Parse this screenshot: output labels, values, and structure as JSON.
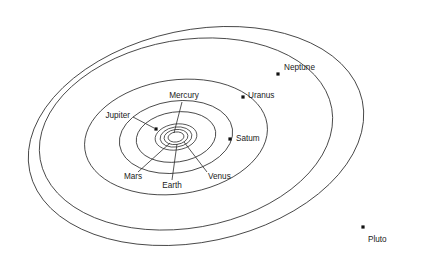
{
  "diagram": {
    "background_color": "#ffffff",
    "line_color": "#2b2b2b",
    "dot_color": "#111111",
    "text_color": "#1a1a1a",
    "center": {
      "x": 176,
      "y": 137
    }
  },
  "planets": [
    {
      "name": "Mercury",
      "label": "Mercury",
      "label_x": 184,
      "label_y": 96,
      "label_anchor": "middle",
      "orbit": {
        "cx": 176,
        "cy": 137,
        "rx": 8,
        "ry": 5,
        "rotation": -8
      },
      "leader": {
        "x1": 182,
        "y1": 102,
        "x2": 174,
        "y2": 133
      },
      "has_dot": false
    },
    {
      "name": "Venus",
      "label": "Venus",
      "label_x": 208,
      "label_y": 177,
      "label_anchor": "start",
      "orbit": {
        "cx": 176,
        "cy": 137,
        "rx": 12,
        "ry": 7.5,
        "rotation": -8
      },
      "leader": {
        "x1": 207,
        "y1": 172,
        "x2": 184,
        "y2": 142
      },
      "has_dot": false
    },
    {
      "name": "Earth",
      "label": "Earth",
      "label_x": 172,
      "label_y": 186,
      "label_anchor": "middle",
      "orbit": {
        "cx": 176,
        "cy": 137,
        "rx": 16,
        "ry": 10,
        "rotation": -8
      },
      "leader": {
        "x1": 172,
        "y1": 180,
        "x2": 177,
        "y2": 144
      },
      "has_dot": false
    },
    {
      "name": "Mars",
      "label": "Mars",
      "label_x": 133,
      "label_y": 177,
      "label_anchor": "middle",
      "orbit": {
        "cx": 176,
        "cy": 137,
        "rx": 21,
        "ry": 13,
        "rotation": -8
      },
      "leader": {
        "x1": 138,
        "y1": 172,
        "x2": 170,
        "y2": 143
      },
      "has_dot": false
    },
    {
      "name": "Jupiter",
      "label": "Jupiter",
      "label_x": 130,
      "label_y": 116,
      "label_anchor": "end",
      "orbit": {
        "cx": 176,
        "cy": 137,
        "rx": 40,
        "ry": 25,
        "rotation": -8
      },
      "leader": {
        "x1": 133,
        "y1": 117,
        "x2": 154,
        "y2": 128
      },
      "has_dot": true,
      "dot_x": 156,
      "dot_y": 129,
      "dot_size": 3.2
    },
    {
      "name": "Saturn",
      "label": "Satum",
      "label_x": 236,
      "label_y": 139,
      "label_anchor": "start",
      "orbit": {
        "cx": 176,
        "cy": 137,
        "rx": 57,
        "ry": 36,
        "rotation": -8
      },
      "leader": null,
      "has_dot": true,
      "dot_x": 230,
      "dot_y": 139,
      "dot_size": 3.2
    },
    {
      "name": "Uranus",
      "label": "Uranus",
      "label_x": 248,
      "label_y": 96,
      "label_anchor": "start",
      "orbit": {
        "cx": 176,
        "cy": 137,
        "rx": 92,
        "ry": 57,
        "rotation": -8
      },
      "leader": null,
      "has_dot": true,
      "dot_x": 243,
      "dot_y": 97,
      "dot_size": 3.2
    },
    {
      "name": "Neptune",
      "label": "Neptune",
      "label_x": 284,
      "label_y": 68,
      "label_anchor": "start",
      "orbit": {
        "cx": 186,
        "cy": 134,
        "rx": 148,
        "ry": 94,
        "rotation": -10
      },
      "leader": null,
      "has_dot": true,
      "dot_x": 278,
      "dot_y": 74,
      "dot_size": 3.2
    },
    {
      "name": "Pluto",
      "label": "Pluto",
      "label_x": 368,
      "label_y": 240,
      "label_anchor": "start",
      "orbit": {
        "cx": 196,
        "cy": 136,
        "rx": 170,
        "ry": 106,
        "rotation": -12
      },
      "leader": null,
      "has_dot": true,
      "dot_x": 363,
      "dot_y": 227,
      "dot_size": 3.2
    }
  ],
  "chart_data": {
    "type": "scatter",
    "xlabel": "",
    "ylabel": "",
    "legend": [],
    "grid": false,
    "categories": [
      "Mercury",
      "Venus",
      "Earth",
      "Mars",
      "Jupiter",
      "Saturn",
      "Uranus",
      "Neptune",
      "Pluto"
    ],
    "series": [
      {
        "name": "Orbit semi-major axis (px)",
        "values": [
          8,
          12,
          16,
          21,
          40,
          57,
          92,
          148,
          170
        ]
      },
      {
        "name": "Orbit semi-minor axis (px)",
        "values": [
          5,
          7.5,
          10,
          13,
          25,
          36,
          57,
          94,
          106
        ]
      },
      {
        "name": "Orbit tilt (deg)",
        "values": [
          -8,
          -8,
          -8,
          -8,
          -8,
          -8,
          -8,
          -10,
          -12
        ]
      }
    ],
    "annotations": [
      "Mercury",
      "Venus",
      "Earth",
      "Mars",
      "Jupiter",
      "Satum",
      "Uranus",
      "Neptune",
      "Pluto"
    ]
  }
}
